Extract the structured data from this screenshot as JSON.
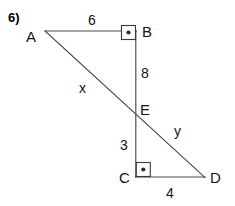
{
  "problem": {
    "number_label": "6)"
  },
  "figure": {
    "vertices": [
      {
        "name": "A",
        "label": "A",
        "x": 45,
        "y": 31
      },
      {
        "name": "B",
        "label": "B",
        "x": 136,
        "y": 31
      },
      {
        "name": "E",
        "label": "E",
        "x": 135,
        "y": 110
      },
      {
        "name": "C",
        "label": "C",
        "x": 136,
        "y": 177
      },
      {
        "name": "D",
        "label": "D",
        "x": 205,
        "y": 177
      }
    ],
    "segments": [
      {
        "name": "AB",
        "from": "A",
        "to": "B",
        "label": "6"
      },
      {
        "name": "BE",
        "from": "B",
        "to": "E",
        "label": "8"
      },
      {
        "name": "EC",
        "from": "E",
        "to": "C",
        "label": "3"
      },
      {
        "name": "CD",
        "from": "C",
        "to": "D",
        "label": "4"
      },
      {
        "name": "AE",
        "from": "A",
        "to": "E",
        "label": "x"
      },
      {
        "name": "ED",
        "from": "E",
        "to": "D",
        "label": "y"
      }
    ],
    "right_angles": [
      {
        "at": "B",
        "marker": "square-with-dot"
      },
      {
        "at": "C",
        "marker": "square-with-dot"
      }
    ],
    "labels": {
      "A": "A",
      "B": "B",
      "C": "C",
      "D": "D",
      "E": "E",
      "ab_length": "6",
      "be_length": "8",
      "ec_length": "3",
      "cd_length": "4",
      "ae_length": "x",
      "ed_length": "y"
    },
    "colors": {
      "line": "#4a4a4a",
      "text": "#151515",
      "background": "#ffffff",
      "marker_dot": "#2b2b2b"
    }
  }
}
